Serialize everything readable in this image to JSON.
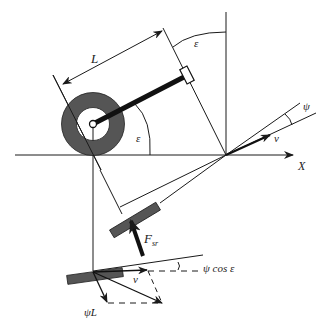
{
  "diagram": {
    "type": "vehicle steering kinematics (caster / self-aligning) diagram",
    "labels": {
      "length": "L",
      "caster_angle_top": "ε",
      "caster_angle_wheel": "ε",
      "slip_angle": "ψ",
      "velocity_top": "v",
      "x_axis": "X",
      "side_force": "F",
      "side_force_sub": "sr",
      "projected_angle": "ψ cos ε",
      "velocity_bottom": "v",
      "yaw_term": "ψ̇L"
    },
    "colors": {
      "line": "#1a1a1a",
      "tire_fill": "#555555",
      "background": "#ffffff"
    }
  }
}
